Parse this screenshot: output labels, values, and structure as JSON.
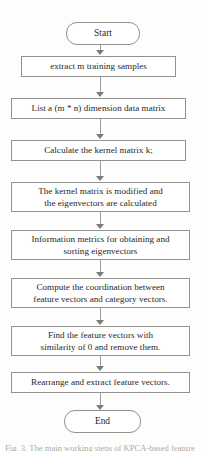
{
  "figure": {
    "type": "flowchart",
    "orientation": "top-to-bottom",
    "title_clipped_top": "",
    "caption_clipped_bottom": "Fig. 3.  The main working steps of KPCA-based feature"
  },
  "nodes": [
    {
      "id": "start",
      "shape": "terminator",
      "label": "Start",
      "line1": "Start",
      "line2": ""
    },
    {
      "id": "step1",
      "shape": "process",
      "label": "extract m training samples",
      "line1": "extract m training samples",
      "line2": ""
    },
    {
      "id": "step2",
      "shape": "process",
      "label": "List a (m * n) dimension data matrix",
      "line1": "List a (m * n) dimension data matrix",
      "line2": ""
    },
    {
      "id": "step3",
      "shape": "process",
      "label": "Calculate the kernel matrix k;",
      "line1": "Calculate the kernel matrix k;",
      "line2": ""
    },
    {
      "id": "step4",
      "shape": "process",
      "label": "The kernel matrix is modified and the eigenvectors are calculated",
      "line1": "The kernel matrix is modified and",
      "line2": "the eigenvectors are calculated"
    },
    {
      "id": "step5",
      "shape": "process",
      "label": "Information metrics for obtaining and sorting eigenvectors",
      "line1": "Information metrics for obtaining and",
      "line2": "sorting eigenvectors"
    },
    {
      "id": "step6",
      "shape": "process",
      "label": "Compute the coordination between feature vectors and category vectors.",
      "line1": "Compute the coordination between",
      "line2": "feature vectors and category vectors."
    },
    {
      "id": "step7",
      "shape": "process",
      "label": "Find the feature vectors with similarity of 0 and remove them.",
      "line1": "Find the feature vectors with",
      "line2": "similarity of 0 and remove them."
    },
    {
      "id": "step8",
      "shape": "process",
      "label": "Rearrange and extract feature vectors.",
      "line1": "Rearrange and extract feature vectors.",
      "line2": ""
    },
    {
      "id": "end",
      "shape": "terminator",
      "label": "End",
      "line1": "End",
      "line2": ""
    }
  ],
  "edges": [
    {
      "from": "start",
      "to": "step1"
    },
    {
      "from": "step1",
      "to": "step2"
    },
    {
      "from": "step2",
      "to": "step3"
    },
    {
      "from": "step3",
      "to": "step4"
    },
    {
      "from": "step4",
      "to": "step5"
    },
    {
      "from": "step5",
      "to": "step6"
    },
    {
      "from": "step6",
      "to": "step7"
    },
    {
      "from": "step7",
      "to": "step8"
    },
    {
      "from": "step8",
      "to": "end"
    }
  ],
  "style": {
    "node_border": "#8e8e8e",
    "node_fill": "#ffffff",
    "connector": "#9a9a9a",
    "arrowhead": "#777777",
    "text": "#1b1b1b",
    "background": "#fdfdfc"
  }
}
